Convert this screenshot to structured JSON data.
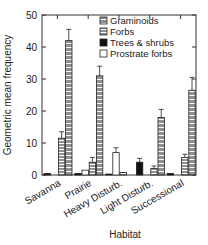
{
  "chart_data": {
    "type": "bar",
    "title": "",
    "xlabel": "Habitat",
    "ylabel": "Geometric mean frequency",
    "ylim": [
      0,
      50
    ],
    "yticks": [
      0,
      10,
      20,
      30,
      40,
      50
    ],
    "categories": [
      "Savanna",
      "Prairie",
      "Heavy Disturb.",
      "Light Disturb.",
      "Successional"
    ],
    "series": [
      {
        "name": "Trees & shrubs",
        "pattern": "solid-black",
        "values": [
          0.5,
          0.5,
          0.3,
          4,
          0.5
        ],
        "errors": [
          0,
          0,
          0,
          1.2,
          0
        ]
      },
      {
        "name": "Prostrate forbs",
        "pattern": "white",
        "values": [
          0,
          1.5,
          7,
          0,
          0
        ],
        "errors": [
          0,
          0,
          1.5,
          0,
          0
        ]
      },
      {
        "name": "Forbs",
        "pattern": "horizontal-stripes",
        "values": [
          11.5,
          4,
          0.8,
          2,
          5.5
        ],
        "errors": [
          2,
          1.5,
          0,
          0.8,
          1
        ]
      },
      {
        "name": "Graminoids",
        "pattern": "grid",
        "values": [
          42,
          31,
          0,
          18,
          26.5
        ],
        "errors": [
          3.5,
          3,
          0,
          2.5,
          4
        ]
      }
    ],
    "legend": {
      "placement": "top-right",
      "entries": [
        "Graminoids",
        "Forbs",
        "Trees & shrubs",
        "Prostrate forbs"
      ]
    },
    "grid": false
  }
}
